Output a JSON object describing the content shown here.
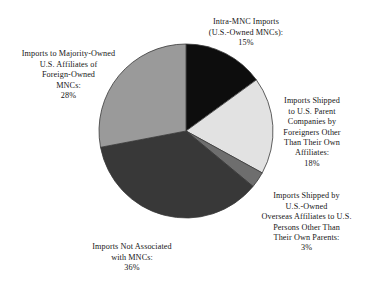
{
  "chart_data": {
    "type": "pie",
    "title": "",
    "subtitle": "",
    "xlabel": "",
    "ylabel": "",
    "legend_position": "none",
    "grid": false,
    "units": "percent",
    "total": 100,
    "start_angle_deg": 0,
    "direction": "clockwise",
    "categories": [
      "Intra-MNC Imports (U.S.-Owned MNCs)",
      "Imports Shipped to U.S. Parent Companies by Foreigners Other Than Their Own Affiliates",
      "Imports Shipped by U.S.-Owned Overseas Affiliates to U.S. Persons Other Than Their Own Parents",
      "Imports Not Associated with MNCs",
      "Imports to Majority-Owned U.S. Affiliates of Foreign-Owned MNCs"
    ],
    "values": [
      15,
      18,
      3,
      36,
      28
    ],
    "colors": [
      "#0d0d0d",
      "#e2e2e2",
      "#6e6e6e",
      "#383838",
      "#9a9a9a"
    ],
    "slices": [
      {
        "name": "intra-mnc-imports",
        "label": "Intra-MNC Imports\n(U.S.-Owned MNCs):",
        "value": 15,
        "value_label": "15%",
        "color": "#0d0d0d"
      },
      {
        "name": "imports-to-us-parent-companies",
        "label": "Imports Shipped\nto U.S. Parent\nCompanies by\nForeigners Other\nThan Their Own\nAffiliates:",
        "value": 18,
        "value_label": "18%",
        "color": "#e2e2e2"
      },
      {
        "name": "imports-by-us-owned-overseas-affiliates",
        "label": "Imports Shipped by\nU.S.-Owned\nOverseas Affiliates to U.S.\nPersons Other Than\nTheir Own Parents:",
        "value": 3,
        "value_label": "3%",
        "color": "#6e6e6e"
      },
      {
        "name": "imports-not-associated-with-mncs",
        "label": "Imports Not Associated\nwith MNCs:",
        "value": 36,
        "value_label": "36%",
        "color": "#383838"
      },
      {
        "name": "imports-to-majority-owned-us-affiliates",
        "label": "Imports to Majority-Owned\nU.S. Affiliates of\nForeign-Owned\nMNCs:",
        "value": 28,
        "value_label": "28%",
        "color": "#9a9a9a"
      }
    ],
    "geometry": {
      "center_x": 186,
      "center_y": 131,
      "radius": 87
    },
    "stroke_color": "#3a3a3a"
  }
}
